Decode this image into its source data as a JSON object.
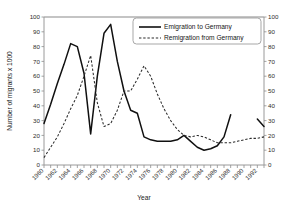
{
  "chart_data": {
    "type": "line",
    "title": "",
    "xlabel": "Year",
    "ylabel": "Number of migrants x 1000",
    "ylabel_right": "",
    "xlim": [
      1960,
      1993
    ],
    "ylim": [
      0,
      100
    ],
    "ytick_step": 10,
    "yticks": [
      0,
      10,
      20,
      30,
      40,
      50,
      60,
      70,
      80,
      90,
      100
    ],
    "yticks_right": [
      0,
      10,
      20,
      30,
      40,
      50,
      60,
      70,
      80,
      90,
      100
    ],
    "xticks": [
      1960,
      1961,
      1962,
      1963,
      1964,
      1965,
      1966,
      1967,
      1968,
      1969,
      1970,
      1971,
      1972,
      1973,
      1974,
      1975,
      1976,
      1977,
      1978,
      1979,
      1980,
      1981,
      1982,
      1983,
      1984,
      1985,
      1986,
      1987,
      1988,
      1989,
      1990,
      1991,
      1992,
      1993
    ],
    "xtick_labels": [
      "1960",
      "1962",
      "1964",
      "1966",
      "1968",
      "1970",
      "1972",
      "1974",
      "1976",
      "1978",
      "1980",
      "1982",
      "1984",
      "1986",
      "1988",
      "1990",
      "1992"
    ],
    "xtick_label_years": [
      1960,
      1962,
      1964,
      1966,
      1968,
      1970,
      1972,
      1974,
      1976,
      1978,
      1980,
      1982,
      1984,
      1986,
      1988,
      1990,
      1992
    ],
    "xtick_label_rotation": -45,
    "grid": false,
    "dual_axis": true,
    "legend_position": "top-right",
    "series": [
      {
        "name": "Emigration to Germany",
        "style": "solid",
        "color": "#101010",
        "x": [
          1960,
          1961,
          1962,
          1963,
          1964,
          1965,
          1966,
          1967,
          1968,
          1969,
          1970,
          1971,
          1972,
          1973,
          1974,
          1975,
          1976,
          1977,
          1978,
          1979,
          1980,
          1981,
          1982,
          1983,
          1984,
          1985,
          1986,
          1987,
          1988
        ],
        "values": [
          28,
          41,
          55,
          68,
          82,
          80,
          62,
          21,
          60,
          89,
          95,
          70,
          50,
          37,
          35,
          19,
          17,
          16,
          16,
          16,
          17,
          20,
          16,
          12,
          10,
          11,
          13,
          19,
          34
        ]
      },
      {
        "name": "Emigration to Germany",
        "style": "solid",
        "color": "#101010",
        "segment": "tail",
        "x": [
          1992,
          1993
        ],
        "values": [
          31,
          26
        ]
      },
      {
        "name": "Remigration from Germany",
        "style": "dashed",
        "color": "#2a2a2a",
        "x": [
          1960,
          1961,
          1962,
          1963,
          1964,
          1965,
          1966,
          1967,
          1968,
          1969,
          1970,
          1971,
          1972,
          1973,
          1974,
          1975,
          1976,
          1977,
          1978,
          1979,
          1980,
          1981,
          1982,
          1983,
          1984,
          1985,
          1986,
          1987,
          1988,
          1989,
          1990,
          1991,
          1992,
          1993
        ],
        "values": [
          5,
          12,
          19,
          28,
          38,
          47,
          60,
          74,
          42,
          26,
          28,
          37,
          50,
          50,
          58,
          67,
          60,
          48,
          38,
          30,
          24,
          20,
          19,
          20,
          19,
          17,
          15,
          15,
          15,
          16,
          17,
          18,
          18,
          19
        ]
      }
    ],
    "legend": [
      {
        "label": "Emigration to Germany",
        "style": "solid"
      },
      {
        "label": "Remigration from Germany",
        "style": "dashed"
      }
    ]
  }
}
